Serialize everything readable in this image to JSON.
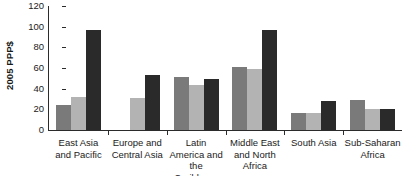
{
  "chart_data": {
    "type": "bar",
    "title": "",
    "xlabel": "",
    "ylabel": "2005 PPP$",
    "ylim": [
      0,
      120
    ],
    "yticks": [
      0,
      20,
      40,
      60,
      80,
      100,
      120
    ],
    "ytick_labels": [
      "0",
      "20",
      "40",
      "60",
      "80",
      "100",
      "120"
    ],
    "grid": false,
    "legend": "none",
    "categories": [
      "East Asia and Pacific",
      "Europe and Central Asia",
      "Latin America and the Caribbean",
      "Middle East and North Africa",
      "South Asia",
      "Sub-Saharan Africa"
    ],
    "series": [
      {
        "name": "series-1",
        "color": "#7a7a7a",
        "values": [
          24,
          null,
          51,
          61,
          16,
          29
        ]
      },
      {
        "name": "series-2",
        "color": "#b3b3b3",
        "values": [
          32,
          31,
          44,
          59,
          16,
          20
        ]
      },
      {
        "name": "series-3",
        "color": "#2a2a2a",
        "values": [
          97,
          53,
          49,
          97,
          28,
          20
        ]
      }
    ]
  },
  "axis": {
    "y_title": "2005 PPP$"
  }
}
